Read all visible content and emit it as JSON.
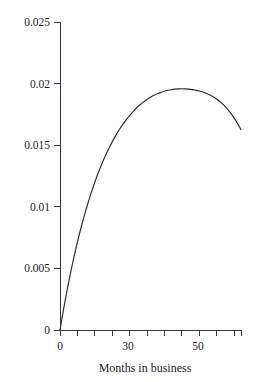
{
  "chart_data": {
    "type": "line",
    "title": "",
    "subtitle": "",
    "xlabel": "Months in business",
    "ylabel": "",
    "xlim": [
      0,
      52
    ],
    "ylim": [
      0,
      0.025
    ],
    "grid": false,
    "legend": null,
    "x_ticks": [
      0,
      5,
      10,
      15,
      20,
      25,
      30,
      35,
      40,
      45,
      50,
      52
    ],
    "x_tick_labels": [
      "0",
      "",
      "",
      "",
      "",
      "",
      "30",
      "",
      "",
      "",
      "50",
      ""
    ],
    "x_major_labels": [
      "0",
      "30",
      "50"
    ],
    "y_ticks": [
      0,
      0.005,
      0.01,
      0.015,
      0.02,
      0.025
    ],
    "y_tick_labels": [
      "0",
      "0.005",
      "0.01",
      "0.015",
      "0.02",
      "0.025"
    ],
    "series": [
      {
        "name": "hazard",
        "color": "#2b2b2b",
        "x": [
          0,
          1,
          2,
          3,
          4,
          5,
          6,
          7,
          8,
          9,
          10,
          11,
          12,
          13,
          14,
          15,
          16,
          17,
          18,
          19,
          20,
          21,
          22,
          23,
          24,
          25,
          26,
          27,
          28,
          29,
          30,
          31,
          32,
          33,
          34,
          35,
          36,
          37,
          38,
          39,
          40,
          41,
          42,
          43,
          44,
          45,
          46,
          47,
          48,
          49,
          50,
          51,
          52
        ],
        "values": [
          0.0,
          0.00165,
          0.00318,
          0.0046,
          0.00591,
          0.00713,
          0.00826,
          0.0093,
          0.01027,
          0.01117,
          0.01199,
          0.01276,
          0.01347,
          0.01412,
          0.01472,
          0.01527,
          0.01578,
          0.01625,
          0.01667,
          0.01706,
          0.01741,
          0.01773,
          0.01802,
          0.01828,
          0.01851,
          0.01871,
          0.01889,
          0.01905,
          0.01918,
          0.01929,
          0.01938,
          0.01946,
          0.01951,
          0.01955,
          0.01957,
          0.01958,
          0.01957,
          0.01955,
          0.01951,
          0.01946,
          0.0194,
          0.01932,
          0.01922,
          0.01909,
          0.01894,
          0.01875,
          0.01853,
          0.01827,
          0.01797,
          0.01762,
          0.01722,
          0.01677,
          0.01626
        ]
      }
    ],
    "peak": {
      "x": 35,
      "y": 0.0196
    },
    "end_point": {
      "x": 52,
      "y": 0.0163
    }
  },
  "axes": {
    "x_title": "Months in business",
    "y_title": ""
  }
}
